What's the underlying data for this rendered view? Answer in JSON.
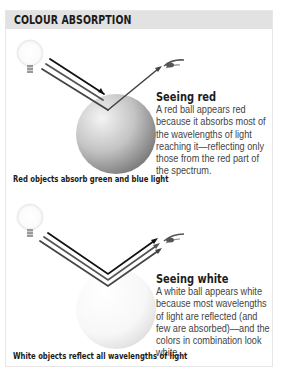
{
  "header": {
    "title": "COLOUR ABSORPTION"
  },
  "figures": [
    {
      "id": "red",
      "heading": "Seeing red",
      "body": "A red ball appears red because it absorbs most of the wavelengths of light reaching it—reflecting only those from the red part of the spectrum.",
      "caption": "Red objects absorb green and blue light",
      "icons": [
        "light-bulb-icon",
        "light-rays",
        "ball",
        "eye-icon"
      ],
      "colors": {
        "ball_light": "#f2f2f2",
        "ball_dark": "#8c8c8c"
      }
    },
    {
      "id": "white",
      "heading": "Seeing white",
      "body": "A white ball appears white because most wavelengths of light are reflected (and few are absorbed)—and the colors in combination look white.",
      "caption": "White objects reflect all wavelengths of light",
      "icons": [
        "light-bulb-icon",
        "light-rays",
        "ball",
        "eye-icon"
      ],
      "colors": {
        "ball_light": "#ffffff",
        "ball_dark": "#e2e2e2"
      }
    }
  ],
  "colors": {
    "header_bg": "#e2e2e2",
    "border": "#e6e6e6",
    "ray": "#2a2a2a"
  }
}
